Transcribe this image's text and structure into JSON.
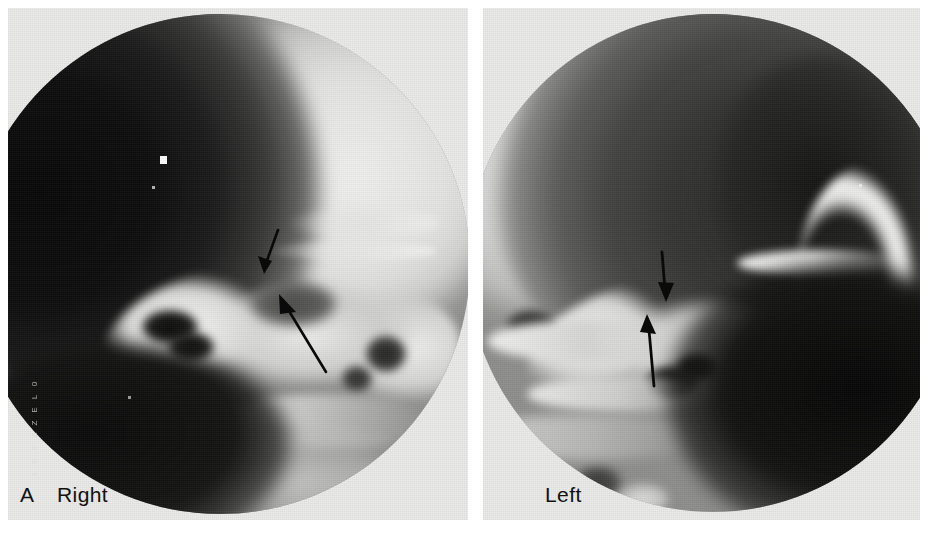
{
  "figure": {
    "type": "radiograph",
    "modality": "plain film radiograph",
    "letter": "A",
    "panel_count": 2
  },
  "panels": [
    {
      "id": "right",
      "side_label": "Right",
      "figure_letter": "A",
      "field_shape": "circular-collimated",
      "annotations": [
        {
          "name": "upper-arrow",
          "direction": "down-left",
          "x": 256,
          "y": 236,
          "length": 44,
          "angle": 242
        },
        {
          "name": "lower-arrow",
          "direction": "up-left",
          "x": 283,
          "y": 296,
          "length": 82,
          "angle": 242
        }
      ]
    },
    {
      "id": "left",
      "side_label": "Left",
      "figure_letter": "",
      "field_shape": "circular-collimated",
      "annotations": [
        {
          "name": "upper-arrow",
          "direction": "down",
          "x": 659,
          "y": 258,
          "length": 48,
          "angle": 268
        },
        {
          "name": "lower-arrow",
          "direction": "up",
          "x": 648,
          "y": 330,
          "length": 72,
          "angle": 268
        }
      ]
    }
  ],
  "labels": {
    "figure_letter": "A",
    "right": "Right",
    "left": "Left"
  },
  "film_edge_marks": [
    "0",
    "L",
    "E",
    "Z",
    "Z",
    "E",
    "0",
    "1"
  ],
  "colors": {
    "page_background": "#ffffff",
    "film_light": "#ececea",
    "film_mid": "#8e8e8c",
    "film_dark": "#0c0c0c",
    "annotation": "#0a0a0a",
    "label_text": "#111110"
  }
}
